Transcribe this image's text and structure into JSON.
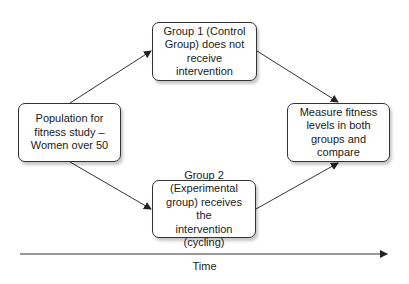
{
  "diagram": {
    "nodes": {
      "population": {
        "label": "Population for\nfitness study –\nWomen over 50"
      },
      "group1": {
        "label": "Group 1 (Control\nGroup) does not\nreceive intervention"
      },
      "group2": {
        "label": "Group 2\n(Experimental\ngroup) receives the\nintervention (cycling)"
      },
      "measure": {
        "label": "Measure fitness\nlevels in both\ngroups and\ncompare"
      }
    },
    "edges": [
      {
        "from": "population",
        "to": "group1"
      },
      {
        "from": "population",
        "to": "group2"
      },
      {
        "from": "group1",
        "to": "measure"
      },
      {
        "from": "group2",
        "to": "measure"
      }
    ],
    "timeline": {
      "label": "Time"
    },
    "colors": {
      "stroke": "#333333",
      "fill": "#ffffff",
      "text": "#1a1a1a"
    }
  }
}
